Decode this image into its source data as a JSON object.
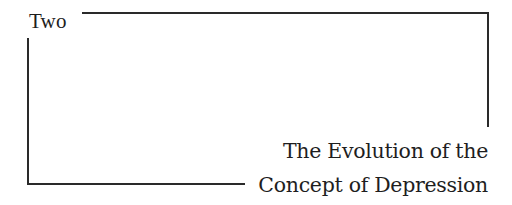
{
  "chapter": {
    "label": "Two"
  },
  "title": {
    "lines": [
      "The Evolution of the",
      "Concept of Depression"
    ]
  },
  "colors": {
    "text": "#1e1e1e",
    "rule": "#2a2a2a",
    "background": "#ffffff"
  }
}
